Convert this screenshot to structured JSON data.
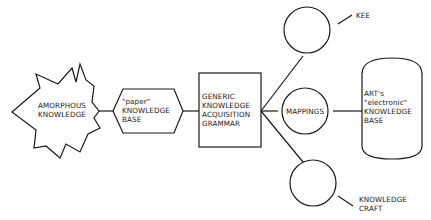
{
  "diagram": {
    "nodes": {
      "amorphous": {
        "lines": [
          "AMORPHOUS",
          "KNOWLEDGE"
        ]
      },
      "paper_kb": {
        "lines": [
          "\"paper\"",
          "KNOWLEDGE",
          "BASE"
        ]
      },
      "grammar": {
        "lines": [
          "GENERIC",
          "KNOWLEDGE",
          "ACQUISITION",
          "GRAMMAR"
        ]
      },
      "kee": {
        "label": "KEE"
      },
      "mappings": {
        "label": "MAPPINGS"
      },
      "knowledge_craft": {
        "lines": [
          "KNOWLEDGE",
          "CRAFT"
        ]
      },
      "art_kb": {
        "lines": [
          "ART's",
          "\"electronic\"",
          "KNOWLEDGE",
          "BASE"
        ]
      }
    },
    "edges": [
      {
        "from": "amorphous",
        "to": "paper_kb"
      },
      {
        "from": "paper_kb",
        "to": "grammar"
      },
      {
        "from": "grammar",
        "to": "kee"
      },
      {
        "from": "grammar",
        "to": "mappings"
      },
      {
        "from": "grammar",
        "to": "knowledge_craft"
      },
      {
        "from": "mappings",
        "to": "art_kb"
      }
    ]
  }
}
